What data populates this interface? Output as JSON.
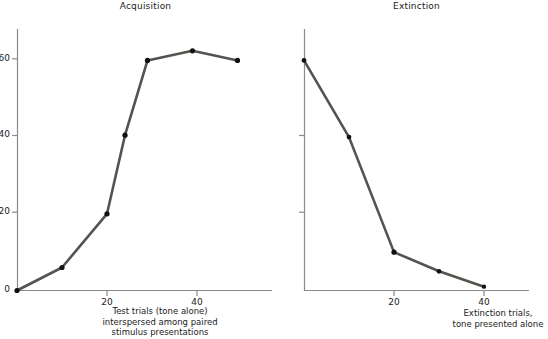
{
  "figure": {
    "background_color": "#ffffff",
    "line_color": "#54544f",
    "marker_color": "#111111",
    "axis_color": "#8a8a8a",
    "text_color": "#1b1b1b"
  },
  "panels": [
    {
      "key": "acquisition",
      "title": "Acquisition",
      "caption": "Test trials (tone alone)\ninterspersed among paired\nstimulus presentations",
      "ytick_labels": [
        "0",
        "20",
        "40",
        "60"
      ],
      "xtick_labels": [
        "20",
        "40"
      ]
    },
    {
      "key": "extinction",
      "title": "Extinction",
      "caption": "Extinction trials,\ntone presented alone",
      "ytick_labels": [
        "",
        "",
        "",
        ""
      ],
      "xtick_labels": [
        "20",
        "40"
      ]
    }
  ],
  "chart_data": [
    {
      "type": "line",
      "title": "Acquisition",
      "xlabel": "Test trials (tone alone) interspersed among paired stimulus presentations",
      "ylabel": "",
      "xlim": [
        0,
        57
      ],
      "ylim": [
        0,
        70
      ],
      "xticks": [
        20,
        40
      ],
      "yticks": [
        0,
        20,
        40,
        60
      ],
      "grid": false,
      "legend": "none",
      "markers": true,
      "x": [
        0,
        10,
        20,
        24,
        29,
        39,
        49
      ],
      "values": [
        0,
        6,
        20,
        40.5,
        60,
        62.5,
        60
      ]
    },
    {
      "type": "line",
      "title": "Extinction",
      "xlabel": "Extinction trials, tone presented alone",
      "ylabel": "",
      "xlim": [
        0,
        57
      ],
      "ylim": [
        0,
        70
      ],
      "xticks": [
        20,
        40
      ],
      "yticks": [
        0,
        20,
        40,
        60
      ],
      "grid": false,
      "legend": "none",
      "markers": true,
      "x": [
        0,
        10,
        20,
        30,
        40
      ],
      "values": [
        60,
        40,
        10,
        5,
        1
      ]
    }
  ]
}
